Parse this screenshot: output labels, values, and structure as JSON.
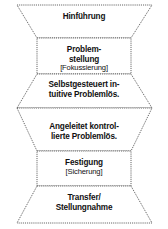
{
  "diagram": {
    "style": {
      "outline_color": "#3a3a3a",
      "fill_color": "#ffffff",
      "text_color": "#111111",
      "background": "#ffffff"
    },
    "segments": [
      {
        "id": "hinfuehrung",
        "shape": "trapezoid-narrowing-down",
        "lines": [
          {
            "text": "Hinführung",
            "emphasis": "primary"
          }
        ]
      },
      {
        "id": "problemstellung",
        "shape": "rectangle",
        "lines": [
          {
            "text": "Problem-",
            "emphasis": "primary"
          },
          {
            "text": "stellung",
            "emphasis": "primary"
          },
          {
            "text": "[Fokussierung]",
            "emphasis": "secondary"
          }
        ]
      },
      {
        "id": "selbstgesteuert",
        "shape": "trapezoid-widening-down",
        "lines": [
          {
            "text": "Selbstgesteuert in-",
            "emphasis": "primary"
          },
          {
            "text": "tuitive Problemlös.",
            "emphasis": "primary"
          }
        ]
      },
      {
        "id": "angeleitet",
        "shape": "trapezoid-narrowing-down",
        "lines": [
          {
            "text": "Angeleitet kontrol-",
            "emphasis": "primary"
          },
          {
            "text": "lierte Problemlös.",
            "emphasis": "primary"
          }
        ]
      },
      {
        "id": "festigung",
        "shape": "rectangle",
        "lines": [
          {
            "text": "Festigung",
            "emphasis": "primary"
          },
          {
            "text": "[Sicherung]",
            "emphasis": "secondary"
          }
        ]
      },
      {
        "id": "transfer",
        "shape": "trapezoid-widening-down",
        "lines": [
          {
            "text": "Transfer/",
            "emphasis": "primary"
          },
          {
            "text": "Stellungnahme",
            "emphasis": "primary"
          }
        ]
      }
    ]
  }
}
